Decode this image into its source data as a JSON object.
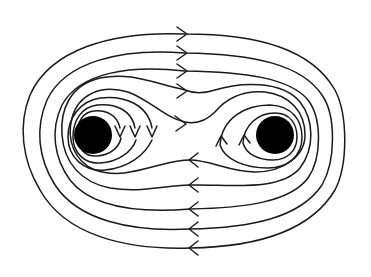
{
  "diagram": {
    "stroke_color": "#1a1a1a",
    "background_color": "#ffffff",
    "vortices": [
      {
        "name": "left-vortex",
        "cx": 93,
        "cy": 135,
        "r": 19,
        "color": "#000000"
      },
      {
        "name": "right-vortex",
        "cx": 275,
        "cy": 135,
        "r": 19,
        "color": "#000000"
      }
    ],
    "outer_streamline_count": 5,
    "inner_streamline_count_per_vortex": 4,
    "top_arrows_direction": "right",
    "bottom_arrows_direction": "left",
    "top_arrow_y": [
      34,
      53,
      71,
      90,
      122
    ],
    "bottom_arrow_y": [
      160,
      185,
      209,
      229,
      248
    ],
    "left_vortex_inner_arrows": "downward (3)",
    "right_vortex_inner_arrows": "upward (2)"
  }
}
